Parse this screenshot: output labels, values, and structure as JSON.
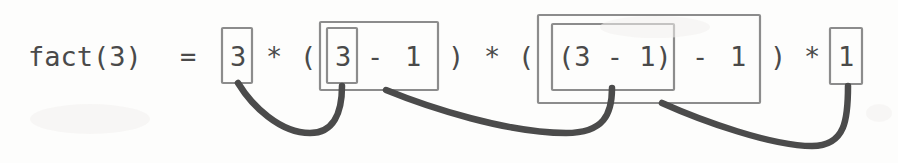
{
  "figure": {
    "name": "fact-3-recursive-expansion",
    "width": 898,
    "height": 163,
    "background_color": "#fdfdfc",
    "box_stroke_color": "#8c8c8c",
    "text_color": "#4a4a4a",
    "arrow_color": "#4b4b4b"
  },
  "expression": {
    "full_text": "fact(3) = 3 * ( 3 - 1 ) * ( (3 - 1) - 1 ) * 1",
    "lhs": "fact(3)",
    "equals": "=",
    "tokens": {
      "call_label": "fact(3)",
      "equals_sign": "=",
      "value_3_first": "3",
      "star_1": "*",
      "paren_open_1": "(",
      "value_3_second": "3",
      "minus_1": "-",
      "one_1": "1",
      "paren_close_1": ")",
      "star_2": "*",
      "paren_open_2": "(",
      "inner_group_2": "(3 - 1)",
      "minus_2": "-",
      "one_2": "1",
      "paren_close_2": ")",
      "star_3": "*",
      "value_1_last": "1"
    }
  },
  "boxes": [
    {
      "id": "box-1",
      "label": "3",
      "level": 1,
      "nesting": "single"
    },
    {
      "id": "box-2-outer",
      "label": "3 - 1",
      "level": 1,
      "nesting": "outer"
    },
    {
      "id": "box-2-inner",
      "label": "3",
      "level": 2,
      "nesting": "inner"
    },
    {
      "id": "box-3-outer",
      "label": "(3 - 1) - 1",
      "level": 1,
      "nesting": "outer"
    },
    {
      "id": "box-3-inner",
      "label": "(3 - 1)",
      "level": 2,
      "nesting": "inner"
    },
    {
      "id": "box-4",
      "label": "1",
      "level": 1,
      "nesting": "single"
    }
  ],
  "connectors": [
    {
      "id": "connector-1",
      "from": "box-1",
      "to": "box-2-inner"
    },
    {
      "id": "connector-2",
      "from": "box-2-outer",
      "to": "box-3-inner"
    },
    {
      "id": "connector-3",
      "from": "box-3-outer",
      "to": "box-4"
    }
  ]
}
